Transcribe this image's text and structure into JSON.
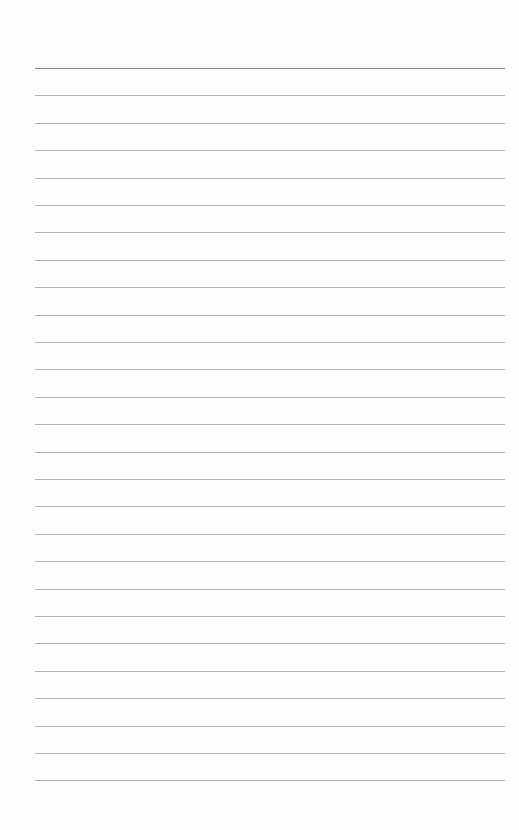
{
  "document": {
    "type": "lined-paper",
    "line_count": 27,
    "first_line_y": 68,
    "line_spacing": 27.4,
    "line_left": 35,
    "line_width": 470,
    "line_color": "#b4b4b4",
    "top_line_color": "#8a8a8a",
    "background": "#fdfdfd"
  }
}
